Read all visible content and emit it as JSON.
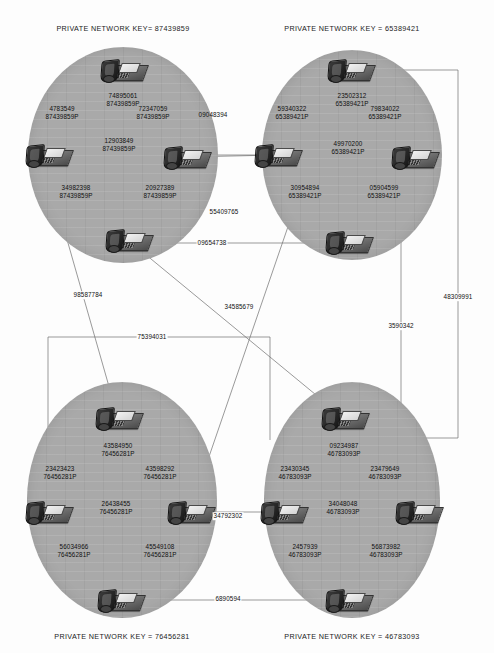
{
  "diagram": {
    "type": "network-topology",
    "cluster_fill": "#a9a9a9",
    "line_color": "#6e6e6e",
    "background": "#fdfdfd"
  },
  "clusters": [
    {
      "id": "cluster-top-left",
      "key_label": "PRIVATE NETWORK KEY= 87439859",
      "key_value": "87439859",
      "position": {
        "cx": 123,
        "cy": 155,
        "rx": 95,
        "ry": 108
      },
      "key_pos": {
        "x": 123,
        "y": 28
      },
      "phones": [
        {
          "id": "tl-top",
          "x": 123,
          "y": 70,
          "label": "74895061+\n87439859P",
          "ext": "74895061",
          "suffix": "87439859P",
          "lx": 123,
          "ly": 100
        },
        {
          "id": "tl-left",
          "x": 48,
          "y": 155,
          "label": "47835 49+\n87439859P",
          "ext": "4783549",
          "suffix": "87439859P",
          "lx": 62,
          "ly": 113
        },
        {
          "id": "tl-right",
          "x": 186,
          "y": 157,
          "label": "72347059+\n87439859P",
          "ext": "72347059",
          "suffix": "87439859P",
          "lx": 153,
          "ly": 113
        },
        {
          "id": "tl-mid",
          "x": 123,
          "y": 155,
          "label": "12903849+\n87439859P",
          "ext": "12903849",
          "suffix": "87439859P",
          "lx": 119,
          "ly": 145
        },
        {
          "id": "tl-bl",
          "x": 60,
          "y": 215,
          "label": "34982398+\n87439859P",
          "ext": "34982398",
          "suffix": "87439859P",
          "lx": 76,
          "ly": 192
        },
        {
          "id": "tl-bot",
          "x": 128,
          "y": 240,
          "label": "20927389+\n87439859P",
          "ext": "20927389",
          "suffix": "87439859P",
          "lx": 160,
          "ly": 192
        }
      ]
    },
    {
      "id": "cluster-top-right",
      "key_label": "PRIVATE NETWORK KEY = 65389421",
      "key_value": "65389421",
      "position": {
        "cx": 352,
        "cy": 155,
        "rx": 90,
        "ry": 105
      },
      "key_pos": {
        "x": 352,
        "y": 28
      },
      "phones": [
        {
          "id": "tr-top",
          "x": 350,
          "y": 70,
          "label": "23502312+\n65389421P",
          "ext": "23502312",
          "suffix": "65389421P",
          "lx": 352,
          "ly": 100
        },
        {
          "id": "tr-left",
          "x": 277,
          "y": 155,
          "label": "59340322+\n65389421P",
          "ext": "59340322",
          "suffix": "65389421P",
          "lx": 292,
          "ly": 113
        },
        {
          "id": "tr-right",
          "x": 414,
          "y": 157,
          "label": "79834022+\n65389421P",
          "ext": "79834022",
          "suffix": "65389421P",
          "lx": 385,
          "ly": 113
        },
        {
          "id": "tr-mid",
          "x": 352,
          "y": 155,
          "label": "49970200+\n65389421P",
          "ext": "49970200",
          "suffix": "65389421P",
          "lx": 348,
          "ly": 148
        },
        {
          "id": "tr-bl",
          "x": 292,
          "y": 215,
          "label": "30954894+\n65389421P",
          "ext": "30954894",
          "suffix": "65389421P",
          "lx": 305,
          "ly": 192
        },
        {
          "id": "tr-bot",
          "x": 348,
          "y": 242,
          "label": "05904599+\n65389421P",
          "ext": "05904599",
          "suffix": "65389421P",
          "lx": 384,
          "ly": 192
        }
      ]
    },
    {
      "id": "cluster-bottom-left",
      "key_label": "PRIVATE NETWORK KEY = 76456281",
      "key_value": "76456281",
      "position": {
        "cx": 122,
        "cy": 500,
        "rx": 95,
        "ry": 118
      },
      "key_pos": {
        "x": 122,
        "y": 637
      },
      "phones": [
        {
          "id": "bl-top",
          "x": 118,
          "y": 418,
          "label": "43584950+\n76456281P",
          "ext": "43584950",
          "suffix": "76456281P",
          "lx": 118,
          "ly": 450
        },
        {
          "id": "bl-left",
          "x": 48,
          "y": 512,
          "label": "23423423+\n76456281P",
          "ext": "23423423",
          "suffix": "76456281P",
          "lx": 60,
          "ly": 473
        },
        {
          "id": "bl-right",
          "x": 190,
          "y": 512,
          "label": "43598292+\n76456281P",
          "ext": "43598292",
          "suffix": "76456281P",
          "lx": 160,
          "ly": 473
        },
        {
          "id": "bl-mid",
          "x": 122,
          "y": 512,
          "label": "26438455+\n76456281P",
          "ext": "26438455",
          "suffix": "76456281P",
          "lx": 116,
          "ly": 508
        },
        {
          "id": "bl-bl",
          "x": 60,
          "y": 570,
          "label": "56034966+\n76456281P",
          "ext": "56034966",
          "suffix": "76456281P",
          "lx": 74,
          "ly": 551
        },
        {
          "id": "bl-bot",
          "x": 120,
          "y": 600,
          "label": "45549108+\n76456281P",
          "ext": "45549108",
          "suffix": "76456281P",
          "lx": 160,
          "ly": 551
        }
      ]
    },
    {
      "id": "cluster-bottom-right",
      "key_label": "PRIVATE NETWORK KEY = 46783093",
      "key_value": "46783093",
      "position": {
        "cx": 352,
        "cy": 500,
        "rx": 88,
        "ry": 118
      },
      "key_pos": {
        "x": 352,
        "y": 637
      },
      "phones": [
        {
          "id": "br-top",
          "x": 344,
          "y": 418,
          "label": "09234987+\n46783093P",
          "ext": "09234987",
          "suffix": "46783093P",
          "lx": 344,
          "ly": 450
        },
        {
          "id": "br-left",
          "x": 283,
          "y": 512,
          "label": "23430345+\n46783093P",
          "ext": "23430345",
          "suffix": "46783093P",
          "lx": 295,
          "ly": 473
        },
        {
          "id": "br-right",
          "x": 418,
          "y": 512,
          "label": "23479649+\n46783093P",
          "ext": "23479649",
          "suffix": "46783093P",
          "lx": 385,
          "ly": 473
        },
        {
          "id": "br-mid",
          "x": 352,
          "y": 512,
          "label": "34048048+\n46783093P",
          "ext": "34048048",
          "suffix": "46783093P",
          "lx": 343,
          "ly": 508
        },
        {
          "id": "br-bl",
          "x": 295,
          "y": 570,
          "label": "2457939+\n46783093P",
          "ext": "2457939",
          "suffix": "46783093P",
          "lx": 305,
          "ly": 551
        },
        {
          "id": "br-bot",
          "x": 348,
          "y": 600,
          "label": "56873982+\n46783093P",
          "ext": "56873982",
          "suffix": "46783093P",
          "lx": 386,
          "ly": 551
        }
      ]
    }
  ],
  "trunks": [
    {
      "id": "trunk-09048394",
      "label": "09048394",
      "x": 213,
      "y": 115,
      "on_white": false
    },
    {
      "id": "trunk-55409765",
      "label": "55409765",
      "x": 224,
      "y": 212,
      "on_white": false
    },
    {
      "id": "trunk-09654738",
      "label": "09654738",
      "x": 212,
      "y": 243,
      "on_white": true
    },
    {
      "id": "trunk-98587784",
      "label": "98587784",
      "x": 88,
      "y": 295,
      "on_white": true
    },
    {
      "id": "trunk-34585679",
      "label": "34585679",
      "x": 239,
      "y": 307,
      "on_white": true
    },
    {
      "id": "trunk-75394031",
      "label": "75394031",
      "x": 152,
      "y": 337,
      "on_white": true
    },
    {
      "id": "trunk-3590342",
      "label": "3590342",
      "x": 401,
      "y": 326,
      "on_white": true
    },
    {
      "id": "trunk-48309991",
      "label": "48309991",
      "x": 458,
      "y": 297,
      "on_white": true
    },
    {
      "id": "trunk-34792302",
      "label": "34792302",
      "x": 228,
      "y": 516,
      "on_white": true
    },
    {
      "id": "trunk-6890594",
      "label": "6890594",
      "x": 228,
      "y": 599,
      "on_white": true
    }
  ]
}
